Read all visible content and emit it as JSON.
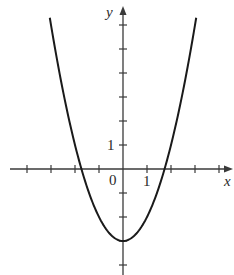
{
  "chart_data": {
    "type": "line",
    "title": "",
    "xlabel": "x",
    "ylabel": "y",
    "function": "y = x^2 - 3",
    "origin_label": "0",
    "x_tick_label": "1",
    "y_tick_label": "1",
    "x_ticks": [
      -4,
      -3,
      -2,
      -1,
      1,
      2,
      3,
      4
    ],
    "y_ticks": [
      -4,
      -3,
      -2,
      -1,
      1,
      2,
      3,
      4,
      5,
      6
    ],
    "xlim": [
      -4.6,
      4.5
    ],
    "ylim": [
      -4.4,
      6.7
    ],
    "series": [
      {
        "name": "parabola",
        "x": [
          -3.05,
          -2.5,
          -2,
          -1.73,
          -1.5,
          -1,
          -0.5,
          0,
          0.5,
          1,
          1.5,
          1.73,
          2,
          2.5,
          3.05
        ],
        "y": [
          6.3,
          3.25,
          1,
          0,
          -0.75,
          -2,
          -2.75,
          -3,
          -2.75,
          -2,
          -0.75,
          0,
          1,
          3.25,
          6.3
        ]
      }
    ],
    "vertex": [
      0,
      -3
    ],
    "x_intercepts": [
      -1.73,
      1.73
    ],
    "grid": false,
    "legend": false
  },
  "colors": {
    "curve": "#1a1a1a",
    "axis": "#3a3a3a",
    "background": "#ffffff"
  }
}
